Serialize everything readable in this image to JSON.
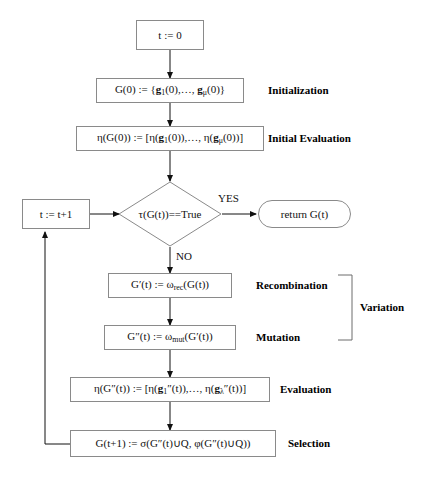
{
  "diagram": {
    "line_color": "#8a8a8a",
    "arrow_color": "#111111",
    "text_color": "#111111",
    "background": "#ffffff"
  },
  "nodes": {
    "init_t": {
      "text": "t := 0",
      "shape": "box"
    },
    "init_pop": {
      "text": "G(0) := {g₁(0),…, gμ(0)}",
      "shape": "box"
    },
    "init_eval": {
      "text": "η(G(0)) := [η(g₁(0)),…, η(gμ(0))]",
      "shape": "box"
    },
    "increment_t": {
      "text": "t := t+1",
      "shape": "box"
    },
    "termination": {
      "text": "τ(G(t))==True",
      "shape": "diamond"
    },
    "return": {
      "text": "return G(t)",
      "shape": "terminal"
    },
    "recombination": {
      "text": "G′(t) := ωrec(G(t))",
      "shape": "box"
    },
    "mutation": {
      "text": "G″(t) := ωmut(G′(t))",
      "shape": "box"
    },
    "evaluation": {
      "text": "η(G″(t)) := [η(g₁″(t)),…, η(gλ″(t))]",
      "shape": "box"
    },
    "selection": {
      "text": "G(t+1) := σ(G″(t)∪Q, φ(G″(t)∪Q))",
      "shape": "box"
    }
  },
  "stage_labels": {
    "initialization": "Initialization",
    "initial_evaluation": "Initial Evaluation",
    "recombination": "Recombination",
    "mutation": "Mutation",
    "variation": "Variation",
    "evaluation": "Evaluation",
    "selection": "Selection"
  },
  "edge_labels": {
    "yes": "YES",
    "no": "NO"
  }
}
